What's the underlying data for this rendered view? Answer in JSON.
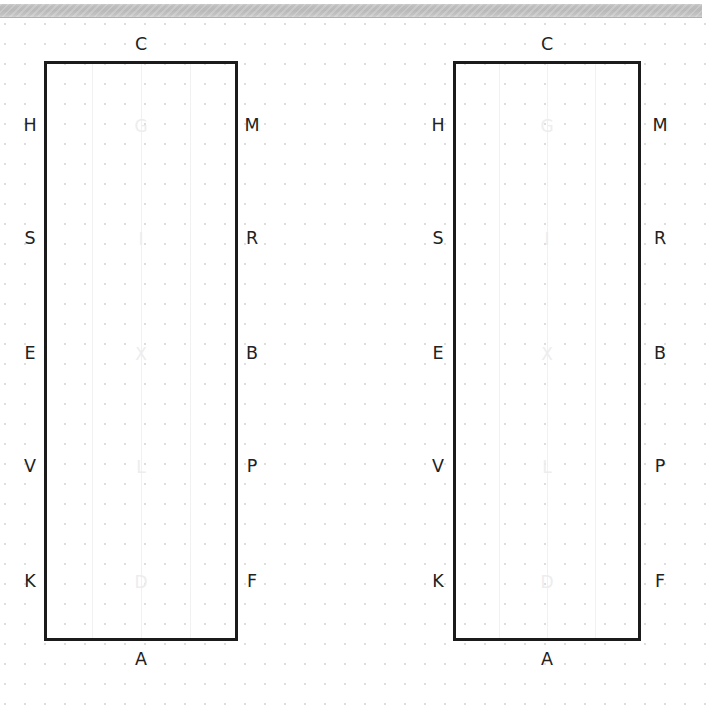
{
  "window": {
    "background_color": "#ffffff",
    "grid_dot_color": "#dedede",
    "grid_spacing_px": 20
  },
  "top_bar": {
    "name": "horizontal-scrollbar",
    "track_color": "#bdbdbd",
    "thumb_label": ""
  },
  "diagram": {
    "type": "two-rectangles-with-edge-labels",
    "outline_color": "#1b1b1b",
    "inner_label_color": "#ededed",
    "outer_label_color": "#222222",
    "figures": [
      {
        "id": "figure-1",
        "top_label": "C",
        "bottom_label": "A",
        "left_labels": [
          "H",
          "S",
          "E",
          "V",
          "K"
        ],
        "right_labels": [
          "M",
          "R",
          "B",
          "P",
          "F"
        ],
        "inner_labels": [
          "G",
          "I",
          "X",
          "L",
          "D"
        ]
      },
      {
        "id": "figure-2",
        "top_label": "C",
        "bottom_label": "A",
        "left_labels": [
          "H",
          "S",
          "E",
          "V",
          "K"
        ],
        "right_labels": [
          "M",
          "R",
          "B",
          "P",
          "F"
        ],
        "inner_labels": [
          "G",
          "I",
          "X",
          "L",
          "D"
        ]
      }
    ]
  }
}
